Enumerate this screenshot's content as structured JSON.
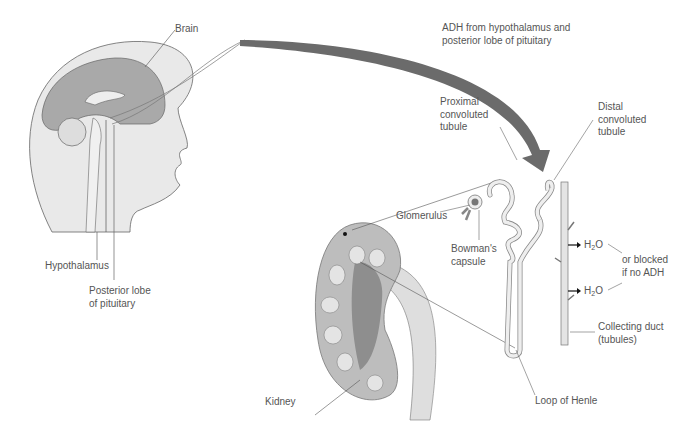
{
  "diagram": {
    "labels": {
      "brain": "Brain",
      "adh_line1": "ADH from hypothalamus and",
      "adh_line2": "posterior lobe of pituitary",
      "proximal_1": "Proximal",
      "proximal_2": "convoluted",
      "proximal_3": "tubule",
      "distal_1": "Distal",
      "distal_2": "convoluted",
      "distal_3": "tubule",
      "glomerulus": "Glomerulus",
      "bowmans_1": "Bowman's",
      "bowmans_2": "capsule",
      "hypothalamus": "Hypothalamus",
      "posterior_1": "Posterior lobe",
      "posterior_2": "of pituitary",
      "h2o_h": "H",
      "h2o_sub": "2",
      "h2o_o": "O",
      "blocked_1": "or blocked",
      "blocked_2": "if no ADH",
      "collecting_1": "Collecting duct",
      "collecting_2": "(tubules)",
      "kidney": "Kidney",
      "loop": "Loop of Henle"
    },
    "colors": {
      "arrow": "#6b6b6b",
      "tissue_light": "#e4e4e4",
      "tissue_mid": "#b3b3b3",
      "tissue_dark": "#8e8e8e",
      "line": "#555555"
    }
  }
}
